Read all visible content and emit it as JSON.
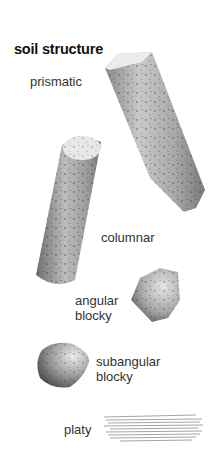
{
  "title": "soil structure",
  "structures": [
    {
      "name": "prismatic",
      "label": "prismatic"
    },
    {
      "name": "columnar",
      "label": "columnar"
    },
    {
      "name": "angular-blocky",
      "label_line1": "angular",
      "label_line2": "blocky"
    },
    {
      "name": "subangular-blocky",
      "label_line1": "subangular",
      "label_line2": "blocky"
    },
    {
      "name": "platy",
      "label": "platy"
    }
  ]
}
